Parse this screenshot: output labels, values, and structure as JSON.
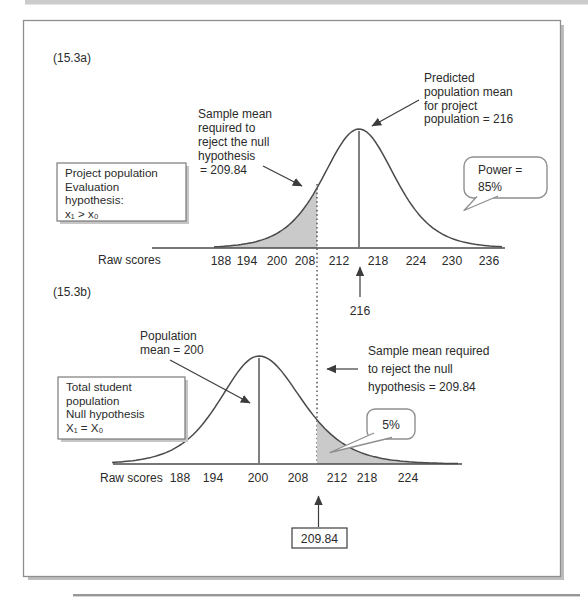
{
  "figure": {
    "colors": {
      "shade": "#cacaca",
      "curve": "#4a4a4a",
      "frame": "#8f8f8f"
    },
    "panel_a": {
      "tag": "(15.3a)",
      "box": [
        "Project population",
        "Evaluation",
        "hypothesis:",
        "x₁ > x₀"
      ],
      "critical_label": [
        "Sample mean",
        "required to",
        "reject the null",
        "hypothesis",
        "= 209.84"
      ],
      "mean_label": [
        "Predicted",
        "population mean",
        "for project",
        "population = 216"
      ],
      "power_bubble": [
        "Power =",
        "85%"
      ],
      "axis_label": "Raw scores",
      "ticks": [
        "188",
        "194",
        "200",
        "208",
        "212",
        "218",
        "224",
        "230",
        "236"
      ],
      "mean_callout": "216"
    },
    "panel_b": {
      "tag": "(15.3b)",
      "box": [
        "Total student",
        "population",
        "Null hypothesis",
        "X₁ = X₀"
      ],
      "mean_label": [
        "Population",
        "mean = 200"
      ],
      "critical_label": [
        "Sample mean required",
        "to reject the null",
        "hypothesis = 209.84"
      ],
      "pct_bubble": "5%",
      "axis_label": "Raw scores",
      "ticks": [
        "188",
        "194",
        "200",
        "208",
        "212",
        "218",
        "224"
      ],
      "critical_callout": "209.84"
    }
  },
  "chart_data": [
    {
      "id": "15.3a",
      "type": "area",
      "description": "Normal sampling distribution for the project (evaluation) population",
      "mean": 216,
      "critical_value": 209.84,
      "power": "85%",
      "shaded_region": "area under curve left of 209.84",
      "xlabel": "Raw scores",
      "x_ticks": [
        188,
        194,
        200,
        208,
        212,
        218,
        224,
        230,
        236
      ],
      "annotations": [
        "Sample mean required to reject the null hypothesis = 209.84",
        "Predicted population mean for project population = 216",
        "Power = 85%",
        "216"
      ]
    },
    {
      "id": "15.3b",
      "type": "area",
      "description": "Normal sampling distribution for the total student population under the null hypothesis",
      "mean": 200,
      "critical_value": 209.84,
      "alpha": "5%",
      "shaded_region": "area under curve right of 209.84",
      "xlabel": "Raw scores",
      "x_ticks": [
        188,
        194,
        200,
        208,
        212,
        218,
        224
      ],
      "annotations": [
        "Population mean = 200",
        "Sample mean required to reject the null hypothesis = 209.84",
        "5%",
        "209.84"
      ]
    }
  ]
}
